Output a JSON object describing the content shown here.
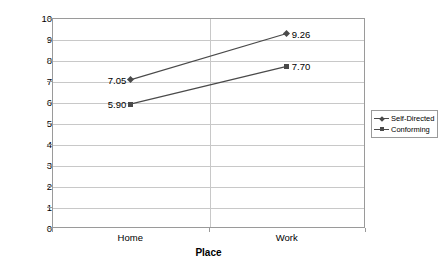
{
  "chart_data": {
    "type": "line",
    "title": "",
    "xlabel": "Place",
    "ylabel": "Mean value for engagement composite variable",
    "categories": [
      "Home",
      "Work"
    ],
    "ylim": [
      0,
      10
    ],
    "yticks": [
      "0",
      "1",
      "2",
      "3",
      "4",
      "5",
      "6",
      "7",
      "8",
      "9",
      "10"
    ],
    "grid": true,
    "legend_position": "right",
    "series": [
      {
        "name": "Self-Directed",
        "marker": "diamond",
        "color": "#4a4a4a",
        "values": [
          7.05,
          9.26
        ],
        "labels": [
          "7.05",
          "9.26"
        ]
      },
      {
        "name": "Conforming",
        "marker": "square",
        "color": "#4a4a4a",
        "values": [
          5.9,
          7.7
        ],
        "labels": [
          "5.90",
          "7.70"
        ]
      }
    ]
  }
}
